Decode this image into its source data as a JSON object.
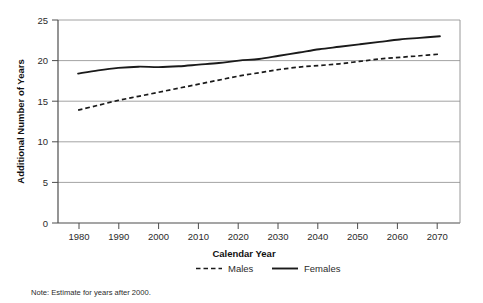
{
  "chart_data": {
    "type": "line",
    "title": "",
    "subtitle": "",
    "xlabel": "Calendar Year",
    "ylabel": "Additional Number of Years",
    "xlim": [
      1975,
      2075
    ],
    "ylim": [
      0,
      25
    ],
    "xticks": [
      1980,
      1990,
      2000,
      2010,
      2020,
      2030,
      2040,
      2050,
      2060,
      2070
    ],
    "yticks": [
      0,
      5,
      10,
      15,
      20,
      25
    ],
    "grid": "horizontal",
    "legend_position": "bottom-center",
    "x": [
      1980,
      1985,
      1990,
      1995,
      2000,
      2005,
      2010,
      2015,
      2020,
      2025,
      2030,
      2035,
      2040,
      2045,
      2050,
      2055,
      2060,
      2065,
      2070
    ],
    "series": [
      {
        "name": "Males",
        "style": "dashed",
        "color": "#1a1a1a",
        "values": [
          13.9,
          14.5,
          15.1,
          15.6,
          16.1,
          16.6,
          17.1,
          17.6,
          18.1,
          18.5,
          18.9,
          19.2,
          19.4,
          19.6,
          19.9,
          20.2,
          20.4,
          20.6,
          20.8
        ]
      },
      {
        "name": "Females",
        "style": "solid",
        "color": "#1a1a1a",
        "values": [
          18.4,
          18.8,
          19.1,
          19.25,
          19.2,
          19.3,
          19.5,
          19.7,
          20.0,
          20.2,
          20.6,
          21.0,
          21.4,
          21.7,
          22.0,
          22.3,
          22.6,
          22.8,
          23.0
        ]
      }
    ],
    "annotations": [
      "Note: Estimate for years after 2000."
    ]
  },
  "axis": {
    "y_title": "Additional Number of Years",
    "x_title": "Calendar Year",
    "y_tick_labels": [
      "25",
      "20",
      "15",
      "10",
      "5",
      "0"
    ],
    "x_tick_labels": [
      "1980",
      "1990",
      "2000",
      "2010",
      "2020",
      "2030",
      "2040",
      "2050",
      "2060",
      "2070"
    ]
  },
  "legend": {
    "items": [
      {
        "label": "Males",
        "style": "dashed"
      },
      {
        "label": "Females",
        "style": "solid"
      }
    ]
  },
  "note": {
    "text": "Note: Estimate for years after 2000."
  },
  "colors": {
    "line": "#1a1a1a",
    "grid": "#8c8c8c",
    "axis": "#4d4d4d",
    "background": "#ffffff",
    "text": "#2b2b2b"
  }
}
